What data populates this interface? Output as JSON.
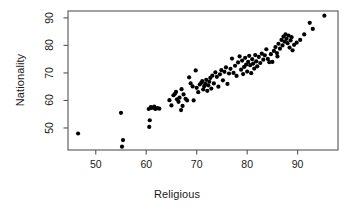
{
  "chart_data": {
    "type": "scatter",
    "title": "",
    "xlabel": "Religious",
    "ylabel": "Nationality",
    "xlim": [
      44.5,
      98.0
    ],
    "ylim": [
      42.0,
      92.5
    ],
    "xticks": [
      50,
      60,
      70,
      80,
      90
    ],
    "yticks": [
      50,
      60,
      70,
      80,
      90
    ],
    "xtick_labels": [
      "50",
      "60",
      "70",
      "80",
      "90"
    ],
    "ytick_labels": [
      "50",
      "60",
      "70",
      "80",
      "90"
    ],
    "grid": false,
    "legend": null,
    "marker": {
      "shape": "circle",
      "filled": true,
      "color": "#000000",
      "size_px": 4.2
    },
    "frame": {
      "box": true,
      "color": "#555555"
    },
    "n_points": 118,
    "points": [
      [
        46.5,
        48.0
      ],
      [
        55.0,
        55.5
      ],
      [
        55.4,
        45.6
      ],
      [
        55.2,
        43.2
      ],
      [
        60.6,
        50.4
      ],
      [
        60.7,
        52.8
      ],
      [
        60.5,
        56.9
      ],
      [
        61.0,
        57.3
      ],
      [
        61.4,
        57.4
      ],
      [
        61.8,
        56.9
      ],
      [
        62.2,
        57.2
      ],
      [
        62.6,
        57.0
      ],
      [
        60.9,
        57.6
      ],
      [
        61.6,
        57.8
      ],
      [
        64.6,
        60.1
      ],
      [
        65.0,
        58.2
      ],
      [
        65.4,
        61.9
      ],
      [
        65.7,
        62.4
      ],
      [
        65.9,
        63.1
      ],
      [
        66.1,
        60.4
      ],
      [
        66.4,
        59.5
      ],
      [
        66.6,
        61.0
      ],
      [
        66.9,
        56.5
      ],
      [
        67.2,
        58.0
      ],
      [
        67.0,
        64.1
      ],
      [
        67.4,
        62.2
      ],
      [
        67.8,
        60.6
      ],
      [
        68.1,
        60.0
      ],
      [
        68.5,
        68.4
      ],
      [
        68.8,
        66.2
      ],
      [
        69.2,
        65.1
      ],
      [
        69.4,
        60.0
      ],
      [
        69.8,
        70.9
      ],
      [
        70.0,
        64.6
      ],
      [
        70.3,
        63.0
      ],
      [
        70.6,
        65.8
      ],
      [
        70.9,
        66.4
      ],
      [
        71.1,
        67.0
      ],
      [
        71.3,
        64.0
      ],
      [
        71.5,
        65.2
      ],
      [
        71.7,
        66.0
      ],
      [
        71.9,
        67.5
      ],
      [
        72.1,
        63.5
      ],
      [
        72.3,
        65.5
      ],
      [
        72.5,
        66.8
      ],
      [
        72.7,
        68.2
      ],
      [
        72.9,
        64.3
      ],
      [
        73.1,
        69.0
      ],
      [
        73.4,
        66.2
      ],
      [
        73.7,
        70.2
      ],
      [
        74.0,
        68.6
      ],
      [
        74.3,
        65.0
      ],
      [
        74.6,
        69.5
      ],
      [
        74.9,
        71.0
      ],
      [
        75.2,
        67.3
      ],
      [
        75.5,
        70.4
      ],
      [
        75.8,
        72.0
      ],
      [
        76.1,
        66.0
      ],
      [
        76.4,
        69.8
      ],
      [
        76.7,
        71.5
      ],
      [
        77.0,
        75.2
      ],
      [
        77.3,
        70.0
      ],
      [
        77.6,
        72.6
      ],
      [
        77.9,
        68.9
      ],
      [
        78.2,
        73.8
      ],
      [
        78.5,
        76.0
      ],
      [
        78.8,
        71.2
      ],
      [
        79.0,
        74.5
      ],
      [
        79.2,
        69.6
      ],
      [
        79.4,
        72.2
      ],
      [
        79.6,
        75.5
      ],
      [
        79.8,
        73.0
      ],
      [
        80.0,
        70.5
      ],
      [
        80.2,
        74.0
      ],
      [
        80.4,
        76.2
      ],
      [
        80.6,
        72.8
      ],
      [
        80.8,
        69.9
      ],
      [
        81.0,
        75.0
      ],
      [
        81.2,
        73.4
      ],
      [
        81.4,
        71.6
      ],
      [
        81.6,
        76.5
      ],
      [
        81.8,
        74.2
      ],
      [
        82.0,
        72.4
      ],
      [
        82.3,
        75.8
      ],
      [
        82.6,
        73.6
      ],
      [
        82.9,
        77.0
      ],
      [
        83.2,
        74.8
      ],
      [
        83.5,
        76.4
      ],
      [
        83.8,
        78.6
      ],
      [
        84.1,
        75.1
      ],
      [
        84.4,
        73.9
      ],
      [
        84.7,
        76.8
      ],
      [
        85.0,
        74.0
      ],
      [
        85.3,
        78.0
      ],
      [
        85.6,
        79.4
      ],
      [
        85.9,
        77.2
      ],
      [
        86.2,
        80.6
      ],
      [
        86.5,
        78.8
      ],
      [
        86.8,
        82.0
      ],
      [
        87.0,
        80.0
      ],
      [
        87.2,
        83.2
      ],
      [
        87.4,
        81.4
      ],
      [
        87.6,
        84.0
      ],
      [
        87.8,
        82.4
      ],
      [
        88.0,
        80.8
      ],
      [
        88.2,
        83.6
      ],
      [
        88.4,
        79.2
      ],
      [
        88.6,
        81.8
      ],
      [
        88.8,
        83.0
      ],
      [
        89.0,
        78.2
      ],
      [
        89.3,
        80.2
      ],
      [
        90.5,
        82.0
      ],
      [
        91.3,
        84.0
      ],
      [
        92.4,
        88.2
      ],
      [
        93.0,
        86.0
      ],
      [
        95.3,
        90.8
      ],
      [
        89.8,
        81.0
      ],
      [
        86.0,
        76.0
      ]
    ]
  }
}
